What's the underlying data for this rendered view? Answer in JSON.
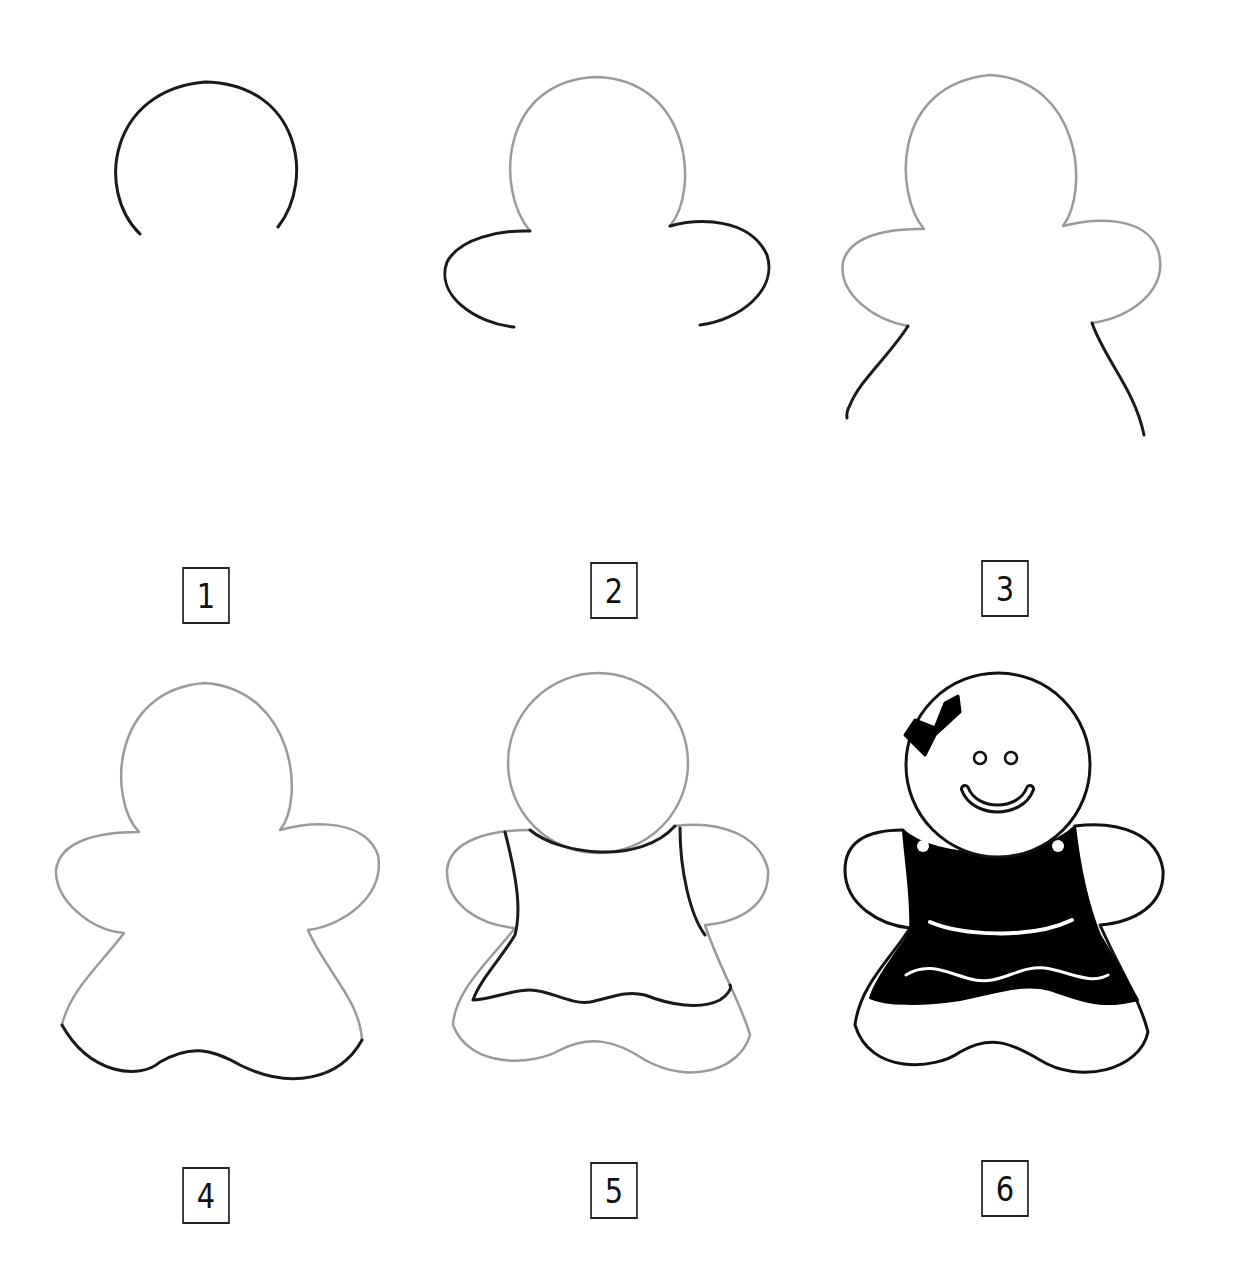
{
  "colors": {
    "new_stroke": "#1a1a1a",
    "previous_stroke": "#9a9a9a",
    "fill": "#000000",
    "background": "#ffffff"
  },
  "steps": [
    {
      "number": "1",
      "description": "head arc",
      "label_pos": [
        178,
        567
      ]
    },
    {
      "number": "2",
      "description": "arms",
      "label_pos": [
        586,
        562
      ]
    },
    {
      "number": "3",
      "description": "body sides",
      "label_pos": [
        977,
        560
      ]
    },
    {
      "number": "4",
      "description": "wavy skirt bottom",
      "label_pos": [
        178,
        1167
      ]
    },
    {
      "number": "5",
      "description": "dress outline",
      "label_pos": [
        586,
        1162
      ]
    },
    {
      "number": "6",
      "description": "finished with bow, face, filled dress",
      "label_pos": [
        977,
        1160
      ]
    }
  ]
}
